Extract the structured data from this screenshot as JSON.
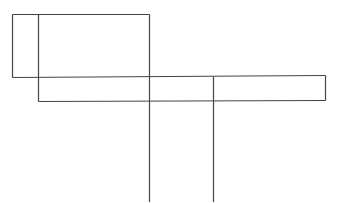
{
  "diagram": {
    "background": "#ffffff",
    "stroke_color": "#444444",
    "lines": [
      {
        "id": "outer-top",
        "x1": 12,
        "y1": 14,
        "x2": 149,
        "y2": 14
      },
      {
        "id": "outer-left",
        "x1": 12,
        "y1": 14,
        "x2": 12,
        "y2": 77
      },
      {
        "id": "outer-bottom",
        "x1": 12,
        "y1": 77,
        "x2": 325,
        "y2": 75
      },
      {
        "id": "inner-left",
        "x1": 38,
        "y1": 14,
        "x2": 38,
        "y2": 101
      },
      {
        "id": "inner-bottom",
        "x1": 38,
        "y1": 101,
        "x2": 325,
        "y2": 100
      },
      {
        "id": "right-edge",
        "x1": 325,
        "y1": 75,
        "x2": 325,
        "y2": 100
      },
      {
        "id": "long-vertical-1",
        "x1": 149,
        "y1": 14,
        "x2": 149,
        "y2": 202
      },
      {
        "id": "long-vertical-2",
        "x1": 213,
        "y1": 76,
        "x2": 213,
        "y2": 202
      }
    ]
  }
}
